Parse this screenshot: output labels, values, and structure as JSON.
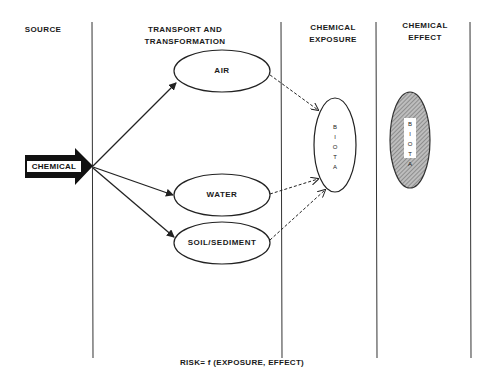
{
  "columns": [
    {
      "id": "source",
      "title_lines": [
        "SOURCE"
      ]
    },
    {
      "id": "transport",
      "title_lines": [
        "TRANSPORT AND",
        "TRANSFORMATION"
      ]
    },
    {
      "id": "exposure",
      "title_lines": [
        "CHEMICAL",
        "EXPOSURE"
      ]
    },
    {
      "id": "effect",
      "title_lines": [
        "CHEMICAL",
        "EFFECT"
      ]
    }
  ],
  "source_node": {
    "label": "CHEMICAL"
  },
  "media": [
    {
      "label": "AIR"
    },
    {
      "label": "WATER"
    },
    {
      "label": "SOIL/SEDIMENT"
    }
  ],
  "exposure_node": {
    "label": "BIOTA",
    "letters": [
      "B",
      "I",
      "O",
      "T",
      "A"
    ]
  },
  "effect_node": {
    "label": "BIOTA",
    "letters": [
      "B",
      "I",
      "O",
      "T",
      "A"
    ]
  },
  "formula": "RISK= f (EXPOSURE, EFFECT)",
  "colors": {
    "line": "#333333",
    "arrow_fill": "#111111",
    "hatch": "#8a8a8a"
  }
}
